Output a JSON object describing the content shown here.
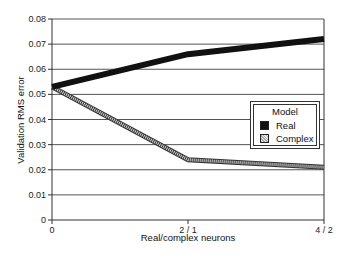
{
  "chart_data": {
    "type": "line",
    "title": "",
    "xlabel": "Real/complex neurons",
    "ylabel": "Validation RMS error",
    "categories": [
      "0",
      "2 / 1",
      "4 / 2"
    ],
    "x": [
      0,
      1,
      2
    ],
    "series": [
      {
        "name": "Real",
        "values": [
          0.053,
          0.066,
          0.072
        ],
        "color": "#111111",
        "style": "thick solid black"
      },
      {
        "name": "Complex",
        "values": [
          0.053,
          0.024,
          0.021
        ],
        "color": "#999999",
        "style": "hatched gray band"
      }
    ],
    "ylim": [
      0,
      0.08
    ],
    "yticks": [
      "0",
      "0.01",
      "0.02",
      "0.03",
      "0.04",
      "0.05",
      "0.06",
      "0.07",
      "0.08"
    ],
    "grid": true,
    "legend": {
      "title": "Model",
      "position": "right-middle",
      "entries": [
        "Real",
        "Complex"
      ]
    }
  }
}
